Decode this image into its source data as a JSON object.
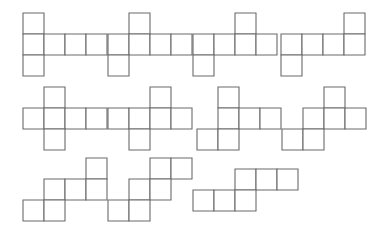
{
  "figure": {
    "background_color": "#ffffff",
    "stroke_color": "#6b6b6b",
    "fill_color": "#ffffff",
    "cell_size_px": 21,
    "canvas": {
      "width": 368,
      "height": 227
    }
  },
  "chart_data": {
    "type": "diagram",
    "cells_per_net": 6,
    "net_count": 11
  },
  "nets": [
    {
      "id": "net-1",
      "label": "Net 1",
      "origin": {
        "x": 22,
        "y": 12
      },
      "cells": [
        {
          "col": 0,
          "row": 0
        },
        {
          "col": 0,
          "row": 1
        },
        {
          "col": 1,
          "row": 1
        },
        {
          "col": 2,
          "row": 1
        },
        {
          "col": 3,
          "row": 1
        },
        {
          "col": 0,
          "row": 2
        }
      ]
    },
    {
      "id": "net-2",
      "label": "Net 2",
      "origin": {
        "x": 107,
        "y": 12
      },
      "cells": [
        {
          "col": 1,
          "row": 0
        },
        {
          "col": 0,
          "row": 1
        },
        {
          "col": 1,
          "row": 1
        },
        {
          "col": 2,
          "row": 1
        },
        {
          "col": 3,
          "row": 1
        },
        {
          "col": 0,
          "row": 2
        }
      ]
    },
    {
      "id": "net-3",
      "label": "Net 3",
      "origin": {
        "x": 192,
        "y": 12
      },
      "cells": [
        {
          "col": 2,
          "row": 0
        },
        {
          "col": 0,
          "row": 1
        },
        {
          "col": 1,
          "row": 1
        },
        {
          "col": 2,
          "row": 1
        },
        {
          "col": 3,
          "row": 1
        },
        {
          "col": 0,
          "row": 2
        }
      ]
    },
    {
      "id": "net-4",
      "label": "Net 4",
      "origin": {
        "x": 280,
        "y": 12
      },
      "cells": [
        {
          "col": 3,
          "row": 0
        },
        {
          "col": 0,
          "row": 1
        },
        {
          "col": 1,
          "row": 1
        },
        {
          "col": 2,
          "row": 1
        },
        {
          "col": 3,
          "row": 1
        },
        {
          "col": 0,
          "row": 2
        }
      ]
    },
    {
      "id": "net-5",
      "label": "Net 5",
      "origin": {
        "x": 22,
        "y": 86
      },
      "cells": [
        {
          "col": 1,
          "row": 0
        },
        {
          "col": 0,
          "row": 1
        },
        {
          "col": 1,
          "row": 1
        },
        {
          "col": 2,
          "row": 1
        },
        {
          "col": 3,
          "row": 1
        },
        {
          "col": 1,
          "row": 2
        }
      ]
    },
    {
      "id": "net-6",
      "label": "Net 6",
      "origin": {
        "x": 107,
        "y": 86
      },
      "cells": [
        {
          "col": 2,
          "row": 0
        },
        {
          "col": 0,
          "row": 1
        },
        {
          "col": 1,
          "row": 1
        },
        {
          "col": 2,
          "row": 1
        },
        {
          "col": 3,
          "row": 1
        },
        {
          "col": 1,
          "row": 2
        }
      ]
    },
    {
      "id": "net-7",
      "label": "Net 7",
      "origin": {
        "x": 196,
        "y": 86
      },
      "cells": [
        {
          "col": 1,
          "row": 0
        },
        {
          "col": 1,
          "row": 1
        },
        {
          "col": 2,
          "row": 1
        },
        {
          "col": 3,
          "row": 1
        },
        {
          "col": 0,
          "row": 2
        },
        {
          "col": 1,
          "row": 2
        }
      ]
    },
    {
      "id": "net-8",
      "label": "Net 8",
      "origin": {
        "x": 281,
        "y": 86
      },
      "cells": [
        {
          "col": 2,
          "row": 0
        },
        {
          "col": 1,
          "row": 1
        },
        {
          "col": 2,
          "row": 1
        },
        {
          "col": 3,
          "row": 1
        },
        {
          "col": 0,
          "row": 2
        },
        {
          "col": 1,
          "row": 2
        }
      ]
    },
    {
      "id": "net-9",
      "label": "Net 9",
      "origin": {
        "x": 22,
        "y": 157
      },
      "cells": [
        {
          "col": 3,
          "row": 0
        },
        {
          "col": 1,
          "row": 1
        },
        {
          "col": 2,
          "row": 1
        },
        {
          "col": 3,
          "row": 1
        },
        {
          "col": 0,
          "row": 2
        },
        {
          "col": 1,
          "row": 2
        }
      ]
    },
    {
      "id": "net-10",
      "label": "Net 10",
      "origin": {
        "x": 107,
        "y": 157
      },
      "cells": [
        {
          "col": 2,
          "row": 0
        },
        {
          "col": 3,
          "row": 0
        },
        {
          "col": 1,
          "row": 1
        },
        {
          "col": 2,
          "row": 1
        },
        {
          "col": 0,
          "row": 2
        },
        {
          "col": 1,
          "row": 2
        }
      ]
    },
    {
      "id": "net-11",
      "label": "Net 11",
      "origin": {
        "x": 192,
        "y": 168
      },
      "cells": [
        {
          "col": 2,
          "row": 0
        },
        {
          "col": 3,
          "row": 0
        },
        {
          "col": 4,
          "row": 0
        },
        {
          "col": 0,
          "row": 1
        },
        {
          "col": 1,
          "row": 1
        },
        {
          "col": 2,
          "row": 1
        }
      ]
    }
  ]
}
